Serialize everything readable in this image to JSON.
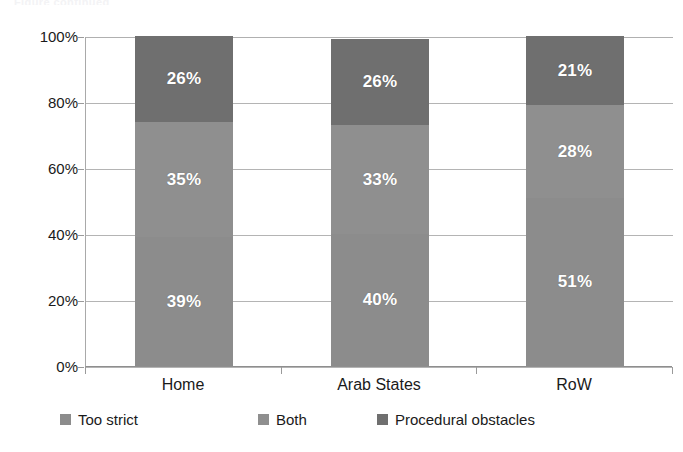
{
  "title_remnant": "Figure continued",
  "chart_data": {
    "type": "bar",
    "variant": "stacked-100-percent",
    "title": "",
    "xlabel": "",
    "ylabel": "",
    "ylim": [
      0,
      100
    ],
    "ytick_labels": [
      "100%",
      "80%",
      "60%",
      "40%",
      "20%",
      "0%"
    ],
    "ytick_values": [
      100,
      80,
      60,
      40,
      20,
      0
    ],
    "grid": true,
    "legend_position": "bottom-left",
    "categories": [
      "Home",
      "Arab States",
      "RoW"
    ],
    "series": [
      {
        "name": "Too strict",
        "color": "#8c8c8c",
        "pattern": "solid",
        "values": [
          39,
          40,
          51
        ],
        "labels": [
          "39%",
          "40%",
          "51%"
        ]
      },
      {
        "name": "Both",
        "color": "#8f8f8f",
        "pattern": "checkered",
        "values": [
          35,
          33,
          28
        ],
        "labels": [
          "35%",
          "33%",
          "28%"
        ]
      },
      {
        "name": "Procedural obstacles",
        "color": "#6f6f6f",
        "pattern": "solid",
        "values": [
          26,
          26,
          21
        ],
        "labels": [
          "26%",
          "26%",
          "21%"
        ]
      }
    ]
  },
  "legend": {
    "items": [
      {
        "label": "Too strict",
        "color": "#8c8c8c",
        "pattern": "solid"
      },
      {
        "label": "Both",
        "color": "#8f8f8f",
        "pattern": "checkered"
      },
      {
        "label": "Procedural obstacles",
        "color": "#6f6f6f",
        "pattern": "solid"
      }
    ]
  }
}
